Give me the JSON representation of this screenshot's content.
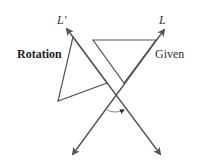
{
  "diagram": {
    "labels": {
      "line_given": "L",
      "line_rotated": "L′",
      "rotation": "Rotation",
      "given": "Given"
    },
    "lines": [
      {
        "name": "L",
        "from": [
          73,
          154
        ],
        "to": [
          164,
          30
        ],
        "arrows": "both"
      },
      {
        "name": "L'",
        "from": [
          160,
          154
        ],
        "to": [
          67,
          29
        ],
        "arrows": "both"
      }
    ],
    "triangles": [
      {
        "name": "Given",
        "vertices": [
          [
            93,
            40
          ],
          [
            156,
            40
          ],
          [
            124,
            83
          ]
        ]
      },
      {
        "name": "Rotation",
        "vertices": [
          [
            73,
            37
          ],
          [
            58,
            101
          ],
          [
            107,
            83
          ]
        ]
      }
    ],
    "angle_arc": {
      "center": [
        115,
        95
      ],
      "direction": "clockwise-arrow"
    },
    "colors": {
      "stroke": "#555555",
      "text": "#333333",
      "background": "#ffffff"
    }
  }
}
